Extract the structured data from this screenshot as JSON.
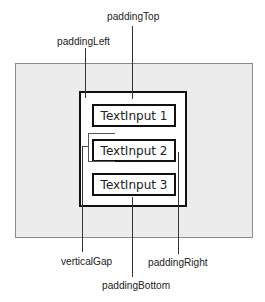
{
  "diagram": {
    "labels": {
      "padding_top": "paddingTop",
      "padding_left": "paddingLeft",
      "vertical_gap": "verticalGap",
      "padding_right": "paddingRight",
      "padding_bottom": "paddingBottom"
    },
    "inputs": [
      {
        "label": "TextInput 1"
      },
      {
        "label": "TextInput 2"
      },
      {
        "label": "TextInput 3"
      }
    ],
    "colors": {
      "panel": "#ececec",
      "border": "#111111",
      "leader": "#333333"
    }
  }
}
